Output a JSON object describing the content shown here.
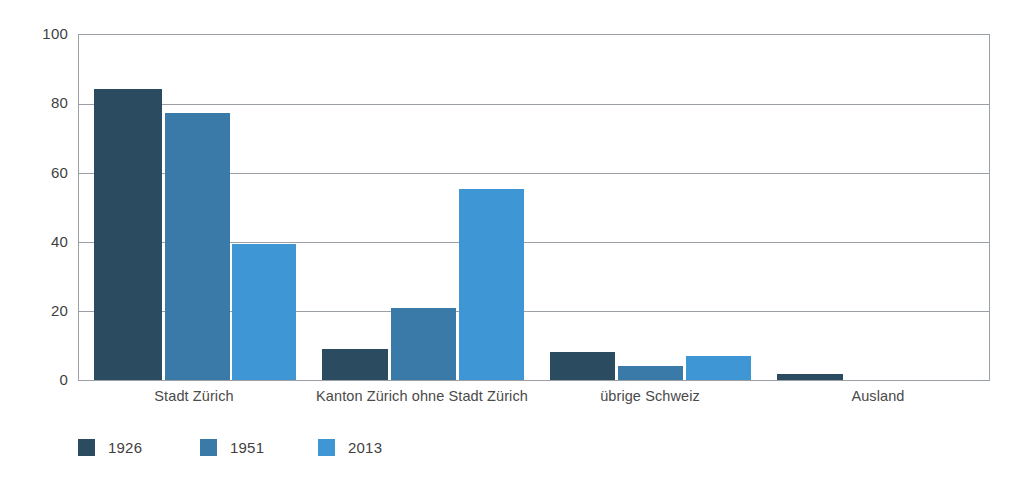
{
  "chart_data": {
    "type": "bar",
    "title": "",
    "subtitle": "",
    "xlabel": "",
    "ylabel": "",
    "ylim": [
      0,
      100
    ],
    "yticks": [
      0,
      20,
      40,
      60,
      80,
      100
    ],
    "ytick_labels": [
      "0",
      "20",
      "40",
      "60",
      "80",
      "100"
    ],
    "grid": true,
    "legend_position": "bottom-left",
    "categories": [
      "Stadt Zürich",
      "Kanton Zürich ohne Stadt Zürich",
      "übrige Schweiz",
      "Ausland"
    ],
    "series": [
      {
        "name": "1926",
        "color": "#2b4b60",
        "values": [
          84.5,
          9.0,
          8.0,
          1.7
        ]
      },
      {
        "name": "1951",
        "color": "#3a7aa8",
        "values": [
          77.5,
          21.0,
          4.0,
          0.0
        ]
      },
      {
        "name": "2013",
        "color": "#3e96d4",
        "values": [
          39.5,
          55.5,
          7.0,
          0.0
        ]
      }
    ]
  },
  "axis": {
    "tick_100": "100",
    "tick_80": "80",
    "tick_60": "60",
    "tick_40": "40",
    "tick_20": "20",
    "tick_0": "0"
  },
  "categories": {
    "c0": "Stadt Zürich",
    "c1": "Kanton Zürich ohne Stadt Zürich",
    "c2": "übrige Schweiz",
    "c3": "Ausland"
  },
  "legend": {
    "items": [
      {
        "label": "1926",
        "color": "#2b4b60"
      },
      {
        "label": "1951",
        "color": "#3a7aa8"
      },
      {
        "label": "2013",
        "color": "#3e96d4"
      }
    ]
  }
}
